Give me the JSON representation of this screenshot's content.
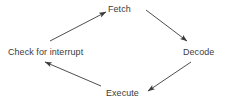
{
  "diagram": {
    "type": "cycle-flow-diagram",
    "background_color": "#ffffff",
    "line_color": "#3a3a3a",
    "text_color": "#3b3b3b",
    "nodes": [
      {
        "id": "fetch",
        "label": "Fetch",
        "position": "top"
      },
      {
        "id": "decode",
        "label": "Decode",
        "position": "right"
      },
      {
        "id": "execute",
        "label": "Execute",
        "position": "bottom"
      },
      {
        "id": "check",
        "label": "Check for interrupt",
        "position": "left"
      }
    ],
    "arrows": [
      {
        "id": "fetch-to-decode",
        "from": "Fetch",
        "to": "Decode",
        "direction": "down-right"
      },
      {
        "id": "decode-to-execute",
        "from": "Decode",
        "to": "Execute",
        "direction": "down-left"
      },
      {
        "id": "execute-to-check",
        "from": "Execute",
        "to": "Check for interrupt",
        "direction": "up-left"
      },
      {
        "id": "check-to-fetch",
        "from": "Check for interrupt",
        "to": "Fetch",
        "direction": "up-right"
      }
    ]
  }
}
